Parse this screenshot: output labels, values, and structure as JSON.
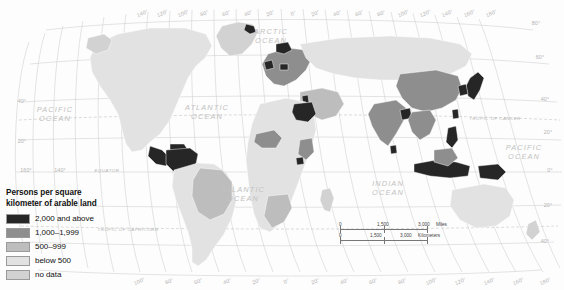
{
  "map": {
    "title_visible": false,
    "background_color": "#fdfdfd",
    "graticule_color": "#c9c9c9",
    "projection_note": "world-thematic-choropleth"
  },
  "legend": {
    "title": "Persons per square\nkilometer of arable land",
    "items": [
      {
        "label": "2,000 and above",
        "color": "#262626",
        "class": "c-2000"
      },
      {
        "label": "1,000–1,999",
        "color": "#8e8e8e",
        "class": "c-1000"
      },
      {
        "label": "500–999",
        "color": "#bdbdbd",
        "class": "c-500"
      },
      {
        "label": "below 500",
        "color": "#e2e2e2",
        "class": "c-below"
      },
      {
        "label": "no data",
        "color": "#d2d2d2",
        "class": "c-nodata"
      }
    ]
  },
  "scale_bar": {
    "miles": {
      "zero": "0",
      "mid": "1,500",
      "end": "3,000",
      "unit": "Miles"
    },
    "kilometers": {
      "zero": "0",
      "mid": "1,500",
      "end": "3,000",
      "unit": "Kilometers"
    }
  },
  "ocean_labels": [
    {
      "name": "ARCTIC OCEAN",
      "line1": "ARCTIC",
      "line2": "OCEAN",
      "x": 271,
      "y": 34
    },
    {
      "name": "PACIFIC OCEAN west",
      "line1": "PACIFIC",
      "line2": "OCEAN",
      "x": 55,
      "y": 112
    },
    {
      "name": "ATLANTIC OCEAN north",
      "line1": "ATLANTIC",
      "line2": "OCEAN",
      "x": 207,
      "y": 110
    },
    {
      "name": "ATLANTIC OCEAN south",
      "line1": "ATLANTIC",
      "line2": "OCEAN",
      "x": 243,
      "y": 192
    },
    {
      "name": "INDIAN OCEAN",
      "line1": "INDIAN",
      "line2": "OCEAN",
      "x": 388,
      "y": 186
    },
    {
      "name": "PACIFIC OCEAN east",
      "line1": "PACIFIC",
      "line2": "OCEAN",
      "x": 524,
      "y": 150
    }
  ],
  "reference_lines": [
    {
      "label": "TROPIC OF CANCER",
      "x": 495,
      "y": 120
    },
    {
      "label": "EQUATOR",
      "x": 107,
      "y": 172
    },
    {
      "label": "TROPIC OF CAPRICORN",
      "x": 128,
      "y": 231
    }
  ],
  "longitude_labels_top": [
    {
      "v": "140°",
      "x": 143
    },
    {
      "v": "120°",
      "x": 163
    },
    {
      "v": "100°",
      "x": 184
    },
    {
      "v": "80°",
      "x": 205
    },
    {
      "v": "60°",
      "x": 227
    },
    {
      "v": "40°",
      "x": 249
    },
    {
      "v": "20°",
      "x": 271
    },
    {
      "v": "0°",
      "x": 294
    },
    {
      "v": "20°",
      "x": 316
    },
    {
      "v": "40°",
      "x": 338
    },
    {
      "v": "60°",
      "x": 360
    },
    {
      "v": "80°",
      "x": 382
    },
    {
      "v": "100°",
      "x": 404
    },
    {
      "v": "120°",
      "x": 426
    },
    {
      "v": "140°",
      "x": 448
    },
    {
      "v": "160°",
      "x": 470
    },
    {
      "v": "180°",
      "x": 492
    }
  ],
  "longitude_labels_bottom": [
    {
      "v": "100°",
      "x": 140
    },
    {
      "v": "80°",
      "x": 170
    },
    {
      "v": "60°",
      "x": 199
    },
    {
      "v": "40°",
      "x": 228
    },
    {
      "v": "20°",
      "x": 257
    },
    {
      "v": "0°",
      "x": 287
    },
    {
      "v": "20°",
      "x": 316
    },
    {
      "v": "40°",
      "x": 345
    },
    {
      "v": "60°",
      "x": 374
    },
    {
      "v": "80°",
      "x": 403
    },
    {
      "v": "100°",
      "x": 432
    },
    {
      "v": "120°",
      "x": 461
    },
    {
      "v": "140°",
      "x": 490
    },
    {
      "v": "160°",
      "x": 519
    },
    {
      "v": "180°",
      "x": 546
    }
  ],
  "latitude_labels_left": [
    {
      "v": "40°",
      "x": 22,
      "y": 103
    },
    {
      "v": "20°",
      "x": 22,
      "y": 143
    },
    {
      "v": "160°",
      "x": 26,
      "y": 172
    },
    {
      "v": "140°",
      "x": 60,
      "y": 172
    }
  ],
  "latitude_labels_right": [
    {
      "v": "80°",
      "x": 536,
      "y": 25
    },
    {
      "v": "60°",
      "x": 540,
      "y": 59
    },
    {
      "v": "40°",
      "x": 545,
      "y": 101
    },
    {
      "v": "20°",
      "x": 548,
      "y": 134
    },
    {
      "v": "0°",
      "x": 550,
      "y": 172
    },
    {
      "v": "20°",
      "x": 548,
      "y": 207
    },
    {
      "v": "40°",
      "x": 545,
      "y": 243
    }
  ],
  "chart_data": {
    "type": "choropleth-map",
    "title": "Persons per square kilometer of arable land",
    "variable": "persons_per_sq_km_arable_land",
    "classes": [
      {
        "label": "2,000 and above",
        "color": "#262626"
      },
      {
        "label": "1,000–1,999",
        "color": "#8e8e8e"
      },
      {
        "label": "500–999",
        "color": "#bdbdbd"
      },
      {
        "label": "below 500",
        "color": "#e2e2e2"
      },
      {
        "label": "no data",
        "color": "#d2d2d2"
      }
    ],
    "highlighted_regions_highest_class": [
      "Japan",
      "South Korea",
      "Egypt",
      "Colombia",
      "Venezuela",
      "Philippines",
      "Indonesia",
      "Norway",
      "Greenland coast",
      "Papua New Guinea"
    ],
    "legend_position": "bottom-left",
    "grid": true
  }
}
